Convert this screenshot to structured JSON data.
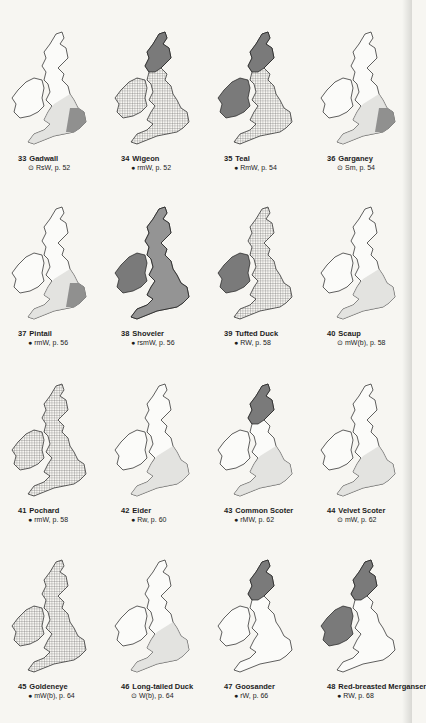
{
  "page": {
    "background": "#f7f6f2",
    "ink": "#1c1c1c",
    "shade_dark": "#7a7a7a",
    "shade_light": "#d9d9d6"
  },
  "maps": [
    {
      "number": "33",
      "name": "Gadwall",
      "symbol": "⊙",
      "ref": "RsW, p. 52",
      "fill": "sparse"
    },
    {
      "number": "34",
      "name": "Wigeon",
      "symbol": "●",
      "ref": "rmW, p. 52",
      "fill": "dense-north-dark"
    },
    {
      "number": "35",
      "name": "Teal",
      "symbol": "●",
      "ref": "RmW, p. 54",
      "fill": "dark-north-grid-south"
    },
    {
      "number": "36",
      "name": "Garganey",
      "symbol": "⊙",
      "ref": "Sm, p. 54",
      "fill": "southeast"
    },
    {
      "number": "37",
      "name": "Pintail",
      "symbol": "●",
      "ref": "rmW, p. 56",
      "fill": "sparse"
    },
    {
      "number": "38",
      "name": "Shoveler",
      "symbol": "●",
      "ref": "rsmW, p. 56",
      "fill": "dark-ireland"
    },
    {
      "number": "39",
      "name": "Tufted Duck",
      "symbol": "●",
      "ref": "RW, p. 58",
      "fill": "dark-ireland-grid"
    },
    {
      "number": "40",
      "name": "Scaup",
      "symbol": "⊙",
      "ref": "mW(b), p. 58",
      "fill": "coastal"
    },
    {
      "number": "41",
      "name": "Pochard",
      "symbol": "●",
      "ref": "rmW, p. 58",
      "fill": "grid"
    },
    {
      "number": "42",
      "name": "Eider",
      "symbol": "●",
      "ref": "Rw, p. 60",
      "fill": "coastal"
    },
    {
      "number": "43",
      "name": "Common Scoter",
      "symbol": "●",
      "ref": "rMW, p. 62",
      "fill": "coastal-north-dark"
    },
    {
      "number": "44",
      "name": "Velvet Scoter",
      "symbol": "⊙",
      "ref": "mW, p. 62",
      "fill": "coastal"
    },
    {
      "number": "45",
      "name": "Goldeneye",
      "symbol": "●",
      "ref": "mW(b), p. 64",
      "fill": "grid"
    },
    {
      "number": "46",
      "name": "Long-tailed Duck",
      "symbol": "⊙",
      "ref": "W(b), p. 64",
      "fill": "coastal"
    },
    {
      "number": "47",
      "name": "Goosander",
      "symbol": "●",
      "ref": "rW, p. 66",
      "fill": "north-dark"
    },
    {
      "number": "48",
      "name": "Red-breasted Merganser",
      "symbol": "●",
      "ref": "RW, p. 68",
      "fill": "north-dark-ireland"
    }
  ]
}
